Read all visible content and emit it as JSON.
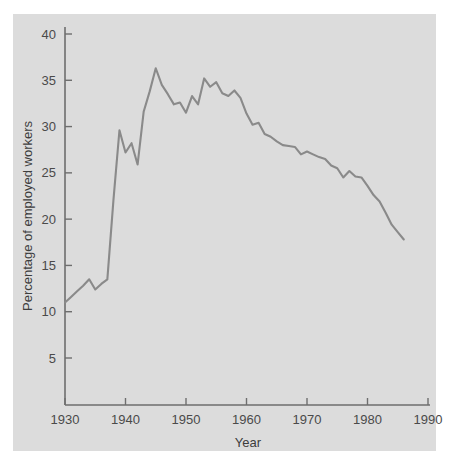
{
  "chart_data": {
    "type": "line",
    "title": "",
    "subtitle": "",
    "xlabel": "Year",
    "ylabel": "Percentage of employed workers",
    "xlim": [
      1929,
      1991
    ],
    "ylim": [
      1.5,
      41.5
    ],
    "xticks": [
      1930,
      1940,
      1950,
      1960,
      1970,
      1980,
      1990
    ],
    "xticklabels": [
      "1930",
      "1940",
      "1950",
      "1960",
      "1970",
      "1980",
      "1990"
    ],
    "yticks": [
      5,
      10,
      15,
      20,
      25,
      30,
      35,
      40
    ],
    "yticklabels": [
      "5",
      "10",
      "15",
      "20",
      "25",
      "30",
      "35",
      "40"
    ],
    "grid": false,
    "legend": null,
    "annotations": [],
    "line_color": "#8a8a8a",
    "panel_color": "#dcdcdc",
    "page_color": "#ffffff",
    "series": [
      {
        "name": "Union membership",
        "x": [
          1930,
          1931,
          1932,
          1933,
          1934,
          1935,
          1936,
          1937,
          1938,
          1939,
          1940,
          1941,
          1942,
          1943,
          1944,
          1945,
          1946,
          1947,
          1948,
          1949,
          1950,
          1951,
          1952,
          1953,
          1954,
          1955,
          1956,
          1957,
          1958,
          1959,
          1960,
          1961,
          1962,
          1963,
          1964,
          1965,
          1966,
          1967,
          1968,
          1969,
          1970,
          1971,
          1972,
          1973,
          1974,
          1975,
          1976,
          1977,
          1978,
          1979,
          1980,
          1981,
          1982,
          1983,
          1984,
          1985,
          1986
        ],
        "values": [
          11.0,
          11.6,
          12.2,
          12.8,
          13.5,
          12.4,
          13.0,
          13.5,
          22.0,
          29.6,
          27.2,
          28.2,
          25.9,
          31.6,
          33.8,
          36.3,
          34.5,
          33.5,
          32.4,
          32.6,
          31.5,
          33.3,
          32.4,
          35.2,
          34.3,
          34.8,
          33.6,
          33.3,
          33.9,
          33.1,
          31.4,
          30.2,
          30.4,
          29.2,
          28.9,
          28.4,
          28.0,
          27.9,
          27.8,
          27.0,
          27.3,
          27.0,
          26.7,
          26.5,
          25.8,
          25.5,
          24.5,
          25.2,
          24.6,
          24.5,
          23.6,
          22.6,
          21.9,
          20.7,
          19.4,
          18.6,
          17.8
        ]
      }
    ]
  }
}
